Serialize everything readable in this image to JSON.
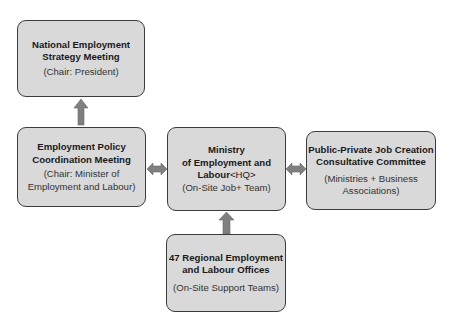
{
  "diagram": {
    "colors": {
      "box_fill": "#d9d9d9",
      "box_border": "#3c3c3c",
      "arrow": "#7f7f7f"
    },
    "nodes": [
      {
        "id": "national",
        "title_lines": [
          "National Employment",
          "Strategy Meeting"
        ],
        "sub_lines": [
          "(Chair: President)"
        ]
      },
      {
        "id": "policy",
        "title_lines": [
          "Employment Policy",
          "Coordination Meeting"
        ],
        "sub_lines": [
          "(Chair: Minister of",
          "Employment and Labour)"
        ]
      },
      {
        "id": "ministry",
        "title_lines": [
          "Ministry",
          "of Employment and",
          "Labour"
        ],
        "title_suffix": "<HQ>",
        "sub_lines": [
          "(On-Site Job+ Team)"
        ]
      },
      {
        "id": "ppp",
        "title_lines": [
          "Public-Private Job Creation",
          "Consultative Committee"
        ],
        "sub_lines": [
          "(Ministries + Business",
          "Associations)"
        ]
      },
      {
        "id": "regional",
        "title_lines": [
          "47 Regional Employment",
          "and Labour Offices"
        ],
        "sub_lines": [
          "(On-Site Support Teams)"
        ]
      }
    ],
    "edges": [
      {
        "from": "policy",
        "to": "national",
        "type": "single-arrow-up"
      },
      {
        "from": "policy",
        "to": "ministry",
        "type": "double-arrow"
      },
      {
        "from": "ministry",
        "to": "ppp",
        "type": "double-arrow"
      },
      {
        "from": "regional",
        "to": "ministry",
        "type": "single-arrow-up"
      }
    ]
  }
}
